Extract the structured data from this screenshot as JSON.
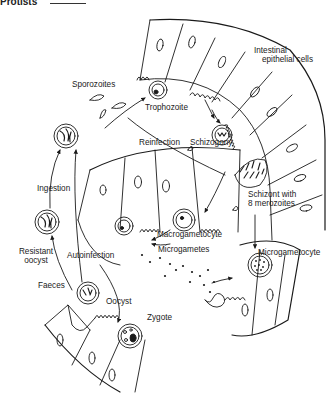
{
  "header": {
    "text": "Protists"
  },
  "diagram": {
    "labels": {
      "intestinal_cells": "Intestinal\nepithelial cells",
      "intestinal_line1": "Intestinal",
      "intestinal_line2": "epithelial cells",
      "sporozoites": "Sporozoites",
      "trophozoite": "Trophozoite",
      "reinfection": "Reinfection",
      "schizogony": "Schizogony",
      "schizont_line1": "Schizont with",
      "schizont_line2": "8 merozoites",
      "ingestion": "Ingestion",
      "resistant_line1": "Resistant",
      "resistant_line2": "oocyst",
      "autoinfection": "Autoinfection",
      "macrogametocyte": "Macrogametocyte",
      "microgametes": "Microgametes",
      "microgametocyte": "Microgametocyte",
      "faeces": "Faeces",
      "oocyst": "Oocyst",
      "zygote": "Zygote"
    },
    "stroke_color": "#1a1a1a",
    "background": "#ffffff"
  }
}
